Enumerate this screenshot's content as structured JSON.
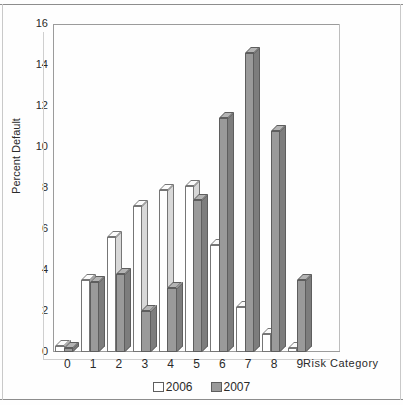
{
  "chart_data": {
    "type": "bar",
    "title": "",
    "xlabel": "Risk Category",
    "ylabel": "Percent Default",
    "categories": [
      "0",
      "1",
      "2",
      "3",
      "4",
      "5",
      "6",
      "7",
      "8",
      "9"
    ],
    "series": [
      {
        "name": "2006",
        "color": "#ffffff",
        "values": [
          0.3,
          3.5,
          5.6,
          7.1,
          7.9,
          8.1,
          5.2,
          2.2,
          0.9,
          0.2
        ]
      },
      {
        "name": "2007",
        "color": "#9a9a9a",
        "values": [
          0.2,
          3.4,
          3.8,
          2.0,
          3.1,
          7.4,
          11.4,
          14.6,
          10.8,
          3.5
        ]
      }
    ],
    "ylim": [
      0,
      16
    ],
    "yticks": [
      "0",
      "2",
      "4",
      "6",
      "8",
      "10",
      "12",
      "14",
      "16"
    ],
    "grid": false,
    "legend_position": "bottom",
    "style": "3d-grouped-bar"
  },
  "legend": {
    "items": [
      {
        "label": "2006"
      },
      {
        "label": "2007"
      }
    ]
  },
  "axes": {
    "y_label": "Percent Default",
    "x_label": "Risk Category"
  }
}
